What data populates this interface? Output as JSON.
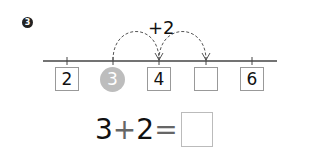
{
  "problem": {
    "number": "3"
  },
  "number_line": {
    "jump_label": "+2",
    "items": [
      {
        "kind": "box",
        "value": "2"
      },
      {
        "kind": "circle",
        "value": "3"
      },
      {
        "kind": "box",
        "value": "4"
      },
      {
        "kind": "box",
        "value": ""
      },
      {
        "kind": "box",
        "value": "6"
      }
    ]
  },
  "equation": {
    "left": "3",
    "op": "+",
    "right": "2",
    "eq": "=",
    "answer": ""
  }
}
